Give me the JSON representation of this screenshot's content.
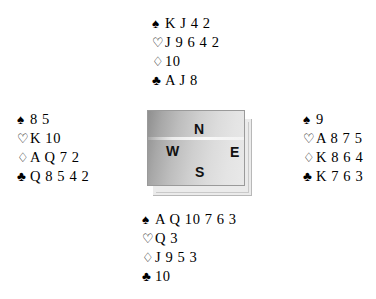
{
  "diagram": {
    "type": "bridge-deal-diagram",
    "background_color": "#ffffff",
    "text_color": "#000000"
  },
  "suits": {
    "spade": {
      "symbol": "♠",
      "name": "spade-symbol",
      "filled": true
    },
    "heart": {
      "symbol": "♡",
      "name": "heart-symbol",
      "filled": false
    },
    "diamond": {
      "symbol": "♢",
      "name": "diamond-symbol",
      "filled": false
    },
    "club": {
      "symbol": "♣",
      "name": "club-symbol",
      "filled": true
    }
  },
  "hands": {
    "north": {
      "label": "North",
      "spades": "K J 4 2",
      "hearts": "J 9 6 4 2",
      "diamonds": "10",
      "clubs": "A J 8"
    },
    "west": {
      "label": "West",
      "spades": "8 5",
      "hearts": "K 10",
      "diamonds": "A Q 7 2",
      "clubs": "Q 8 5 4 2"
    },
    "east": {
      "label": "East",
      "spades": "9",
      "hearts": "A 8 7 5",
      "diamonds": "K 8 6 4",
      "clubs": "K 7 6 3"
    },
    "south": {
      "label": "South",
      "spades": "A Q 10 7 6 3",
      "hearts": "Q 3",
      "diamonds": "J 9 5 3",
      "clubs": "10"
    }
  },
  "compass": {
    "north": "N",
    "east": "E",
    "south": "S",
    "west": "W",
    "box_gradient_from": "#8f8f8f",
    "box_gradient_to": "#e9e9e9",
    "shadow_color": "#ebebeb"
  }
}
